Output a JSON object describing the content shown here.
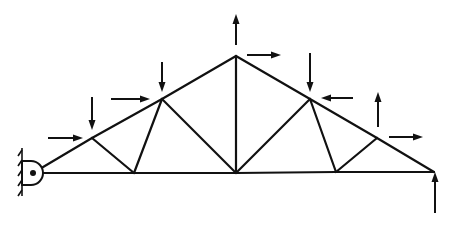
{
  "diagram": {
    "type": "roof truss with applied nodal loads",
    "colors": {
      "line": "#111111",
      "background": "#ffffff"
    },
    "nodes": {
      "L0": "left support (pin)",
      "U1": "top chord node 1",
      "U2": "top chord node 2",
      "U3": "apex",
      "U4": "top chord node 4",
      "U5": "top chord node 5",
      "L6": "right support (roller)",
      "L1": "bottom chord node 1",
      "L3": "bottom chord center node",
      "L5": "bottom chord node 5"
    },
    "members": [
      [
        "L0",
        "U1"
      ],
      [
        "U1",
        "U2"
      ],
      [
        "U2",
        "U3"
      ],
      [
        "U3",
        "U4"
      ],
      [
        "U4",
        "U5"
      ],
      [
        "U5",
        "L6"
      ],
      [
        "L0",
        "L1"
      ],
      [
        "L1",
        "L3"
      ],
      [
        "L3",
        "L5"
      ],
      [
        "L5",
        "L6"
      ],
      [
        "U1",
        "L1"
      ],
      [
        "L1",
        "U2"
      ],
      [
        "U2",
        "L3"
      ],
      [
        "U3",
        "L3"
      ],
      [
        "L3",
        "U4"
      ],
      [
        "U4",
        "L5"
      ],
      [
        "L5",
        "U5"
      ]
    ],
    "loads": [
      {
        "node": "U1",
        "direction": "down"
      },
      {
        "node": "U1",
        "direction": "right"
      },
      {
        "node": "U2",
        "direction": "down"
      },
      {
        "node": "U2",
        "direction": "right"
      },
      {
        "node": "U3",
        "direction": "up"
      },
      {
        "node": "U3",
        "direction": "right"
      },
      {
        "node": "U4",
        "direction": "down"
      },
      {
        "node": "U4",
        "direction": "left"
      },
      {
        "node": "U5",
        "direction": "up"
      },
      {
        "node": "U5",
        "direction": "right"
      },
      {
        "node": "L6",
        "direction": "up",
        "label": "support reaction"
      }
    ],
    "supports": [
      {
        "node": "L0",
        "kind": "pin to wall"
      },
      {
        "node": "L6",
        "kind": "vertical reaction"
      }
    ]
  }
}
